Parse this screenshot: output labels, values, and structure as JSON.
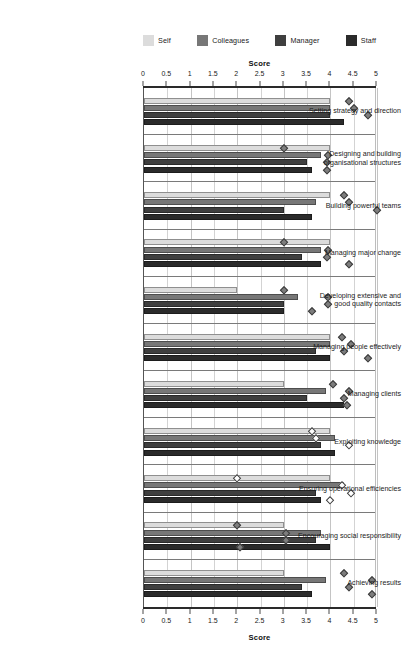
{
  "chart_data": {
    "type": "bar",
    "orientation": "horizontal",
    "title": "",
    "xlabel": "Score",
    "ylabel": "",
    "xlim": [
      0,
      5
    ],
    "xticks": [
      0,
      0.5,
      1,
      1.5,
      2,
      2.5,
      3,
      3.5,
      4,
      4.5,
      5
    ],
    "xticklabels": [
      "0",
      "0.5",
      "1",
      "1.5",
      "2",
      "2.5",
      "3",
      "3.5",
      "4",
      "4.5",
      "5"
    ],
    "grid": true,
    "legend_position": "top",
    "axis_duplicated_top_and_bottom": true,
    "categories": [
      "Setting strategy and direction",
      "Designing and building organisational structures",
      "Building powerful teams",
      "Managing major change",
      "Developing extensive and good quality contacts",
      "Managing people effectively",
      "Managing clients",
      "Exploiting knowledge",
      "Ensuring operational efficiencies",
      "Encouraging social responsibility",
      "Achieving results"
    ],
    "category_label_lines": [
      [
        "Setting strategy and direction"
      ],
      [
        "Designing and building",
        "organisational structures"
      ],
      [
        "Building powerful teams"
      ],
      [
        "Managing major change"
      ],
      [
        "Developing extensive and",
        "good quality contacts"
      ],
      [
        "Managing people effectively"
      ],
      [
        "Managing clients"
      ],
      [
        "Exploiting knowledge"
      ],
      [
        "Ensuring operational efficiencies"
      ],
      [
        "Encouraging social responsibility"
      ],
      [
        "Achieving results"
      ]
    ],
    "series": [
      {
        "name": "Self",
        "color": "#dcdcdc",
        "values": [
          4.0,
          4.0,
          4.0,
          4.0,
          2.0,
          4.0,
          3.0,
          4.0,
          4.0,
          3.0,
          3.0
        ]
      },
      {
        "name": "Colleagues",
        "color": "#777777",
        "values": [
          4.0,
          3.8,
          3.7,
          3.8,
          3.3,
          4.0,
          3.9,
          4.1,
          4.3,
          3.8,
          3.9
        ]
      },
      {
        "name": "Manager",
        "color": "#3f3f3f",
        "values": [
          4.0,
          3.5,
          3.0,
          3.4,
          3.0,
          3.7,
          3.5,
          3.8,
          3.7,
          3.7,
          3.4
        ]
      },
      {
        "name": "Staff",
        "color": "#2b2b2b",
        "values": [
          4.3,
          3.6,
          3.6,
          3.8,
          3.0,
          4.0,
          4.3,
          4.1,
          3.8,
          4.0,
          3.6
        ]
      }
    ],
    "markers": [
      {
        "category_index": 0,
        "values": [
          4.4,
          4.5,
          4.8
        ],
        "style": "filled"
      },
      {
        "category_index": 1,
        "values": [
          3.0,
          3.95,
          3.93,
          3.93
        ],
        "style": "filled"
      },
      {
        "category_index": 2,
        "values": [
          4.3,
          4.4,
          5.0
        ],
        "style": "filled"
      },
      {
        "category_index": 3,
        "values": [
          3.0,
          3.95,
          3.92,
          4.4
        ],
        "style": "filled"
      },
      {
        "category_index": 4,
        "values": [
          3.0,
          3.95,
          3.95,
          3.6
        ],
        "style": "filled"
      },
      {
        "category_index": 5,
        "values": [
          4.25,
          4.45,
          4.3,
          4.8
        ],
        "style": "filled"
      },
      {
        "category_index": 6,
        "values": [
          4.05,
          4.4,
          4.3,
          4.35
        ],
        "style": "filled"
      },
      {
        "category_index": 7,
        "values": [
          3.6,
          3.7,
          4.4
        ],
        "style": "hollow"
      },
      {
        "category_index": 8,
        "values": [
          2.0,
          4.25,
          4.45,
          4.0
        ],
        "style": "hollow"
      },
      {
        "category_index": 9,
        "values": [
          2.0,
          3.05,
          3.05,
          2.05
        ],
        "style": "filled"
      },
      {
        "category_index": 10,
        "values": [
          4.3,
          4.9,
          4.4,
          4.9
        ],
        "style": "filled"
      }
    ]
  },
  "legend": {
    "items": [
      {
        "label": "Self",
        "color": "#dcdcdc"
      },
      {
        "label": "Colleagues",
        "color": "#777777"
      },
      {
        "label": "Manager",
        "color": "#3f3f3f"
      },
      {
        "label": "Staff",
        "color": "#2b2b2b"
      }
    ]
  },
  "axis": {
    "title_top": "Score",
    "title_bottom": "Score"
  }
}
